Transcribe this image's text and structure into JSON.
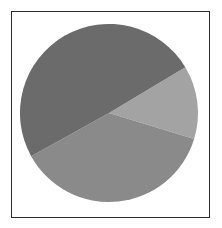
{
  "figure": {
    "background_color": "#ffffff",
    "frame": {
      "border_color": "#2b2b2b",
      "fill_color": "#ffffff"
    }
  },
  "chart_data": {
    "type": "pie",
    "title": "",
    "subtitle": "",
    "xlabel": "",
    "ylabel": "",
    "legend": false,
    "legend_position": "none",
    "grid": false,
    "labels_shown": false,
    "center": {
      "cx": 109,
      "cy": 113
    },
    "radius": 89,
    "start_angle_deg": 59,
    "direction": "clockwise",
    "categories": [
      "Slice 1",
      "Slice 2",
      "Slice 3"
    ],
    "values": [
      13.3,
      37.2,
      49.5
    ],
    "angles_deg": [
      48,
      134,
      178
    ],
    "colors": [
      "#a3a3a3",
      "#8a8a8a",
      "#6b6b6b"
    ],
    "slices": [
      {
        "name": "Slice 1",
        "value": 13.3,
        "angle_deg": 48,
        "start_deg": 59,
        "end_deg": 107,
        "color": "#a3a3a3",
        "label": ""
      },
      {
        "name": "Slice 2",
        "value": 37.2,
        "angle_deg": 134,
        "start_deg": 107,
        "end_deg": 241,
        "color": "#8a8a8a",
        "label": ""
      },
      {
        "name": "Slice 3",
        "value": 49.5,
        "angle_deg": 178,
        "start_deg": 241,
        "end_deg": 419,
        "color": "#6b6b6b",
        "label": ""
      }
    ]
  }
}
